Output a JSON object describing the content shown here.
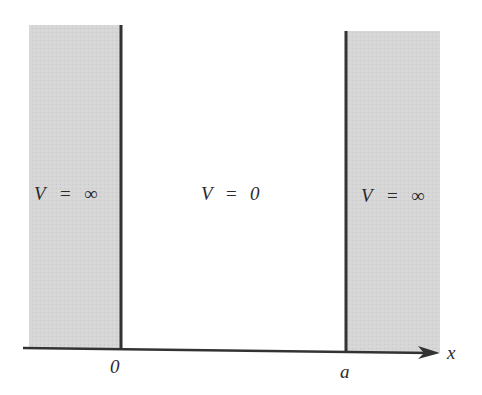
{
  "diagram": {
    "regions": [
      {
        "id": "left",
        "label_V": "V",
        "label_eq": "=",
        "label_val": "∞",
        "fill": "#d6d6d6"
      },
      {
        "id": "middle",
        "label_V": "V",
        "label_eq": "=",
        "label_val": "0",
        "fill": "#ffffff"
      },
      {
        "id": "right",
        "label_V": "V",
        "label_eq": "=",
        "label_val": "∞",
        "fill": "#d6d6d6"
      }
    ],
    "axis": {
      "label": "x",
      "ticks": [
        {
          "label": "0"
        },
        {
          "label": "a"
        }
      ]
    },
    "colors": {
      "wall": "#333333",
      "shade": "#d6d6d6",
      "axis": "#333333"
    }
  }
}
